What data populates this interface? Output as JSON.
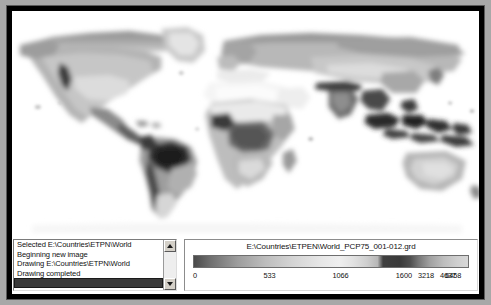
{
  "window": {
    "title": "GIS Map Viewer"
  },
  "map": {
    "name": "world-precipitation-map",
    "description": "Grayscale world precipitation raster map",
    "background_color": "#ffffff",
    "projection": "equirectangular"
  },
  "log": {
    "items": [
      {
        "text": "Selected E:\\Countries\\ETPN\\World",
        "selected": false
      },
      {
        "text": "Beginning new image",
        "selected": false
      },
      {
        "text": "Drawing E:\\Countries\\ETPN\\World",
        "selected": false
      },
      {
        "text": "Drawing completed",
        "selected": false
      },
      {
        "text": "",
        "selected": true
      }
    ],
    "scrollbar": {
      "up_arrow": "scroll-up-icon",
      "down_arrow": "scroll-down-icon"
    }
  },
  "legend": {
    "title": "E:\\Countries\\ETPEN\\World_PCP75_001-012.grd",
    "ticks": [
      {
        "label": "0",
        "pos": 0.0
      },
      {
        "label": "533",
        "pos": 0.255
      },
      {
        "label": "1066",
        "pos": 0.505
      },
      {
        "label": "1600",
        "pos": 0.735
      },
      {
        "label": "3218",
        "pos": 0.815
      },
      {
        "label": "4637",
        "pos": 0.895
      },
      {
        "label": "6458",
        "pos": 0.972
      }
    ],
    "colorbar": {
      "type": "grayscale-ramp",
      "min": 0,
      "max": 6458
    }
  },
  "colors": {
    "window_border": "#000000",
    "panel_background": "#ffffff",
    "text": "#111111",
    "selection": "#3a3a3a",
    "chrome": "#d4d0c8"
  }
}
